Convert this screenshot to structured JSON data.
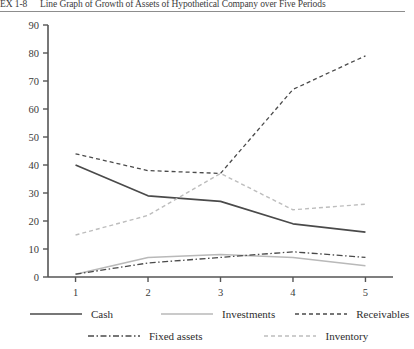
{
  "figure": {
    "tag": "EX 1-8",
    "title": "Line Graph of Growth of Assets of Hypothetical Company over Five Periods"
  },
  "legend": {
    "position": "below-plot",
    "items": [
      {
        "label": "Cash",
        "style": "solid",
        "color": "#4a4a4a",
        "width": 1.7
      },
      {
        "label": "Investments",
        "style": "solid",
        "color": "#b9b9b9",
        "width": 1.4
      },
      {
        "label": "Receivables",
        "style": "dashed",
        "color": "#4a4a4a",
        "width": 1.3
      },
      {
        "label": "Fixed assets",
        "style": "dash-dot",
        "color": "#4a4a4a",
        "width": 1.3
      },
      {
        "label": "Inventory",
        "style": "dashed",
        "color": "#bdbdbd",
        "width": 1.3
      }
    ]
  },
  "axes": {
    "y_ticks": [
      "0",
      "10",
      "20",
      "30",
      "40",
      "50",
      "60",
      "70",
      "80",
      "90"
    ],
    "x_ticks": [
      "1",
      "2",
      "3",
      "4",
      "5"
    ],
    "axis_color": "#555555"
  },
  "chart_data": {
    "type": "line",
    "title": "Line Graph of Growth of Assets of Hypothetical Company over Five Periods",
    "xlabel": "",
    "ylabel": "",
    "x": [
      1,
      2,
      3,
      4,
      5
    ],
    "categories": [
      "1",
      "2",
      "3",
      "4",
      "5"
    ],
    "xlim": [
      0.62,
      5.38
    ],
    "ylim": [
      0,
      90
    ],
    "yticks": [
      0,
      10,
      20,
      30,
      40,
      50,
      60,
      70,
      80,
      90
    ],
    "grid": false,
    "legend_position": "bottom",
    "series": [
      {
        "name": "Cash",
        "values": [
          40,
          29,
          27,
          19,
          16
        ],
        "style": "solid",
        "color": "#4a4a4a"
      },
      {
        "name": "Investments",
        "values": [
          1,
          7,
          8,
          7,
          4
        ],
        "style": "solid",
        "color": "#b9b9b9"
      },
      {
        "name": "Receivables",
        "values": [
          44,
          38,
          37,
          67,
          79
        ],
        "style": "dashed",
        "color": "#4a4a4a"
      },
      {
        "name": "Fixed assets",
        "values": [
          1,
          5,
          7,
          9,
          7
        ],
        "style": "dash-dot",
        "color": "#4a4a4a"
      },
      {
        "name": "Inventory",
        "values": [
          15,
          22,
          37,
          24,
          26
        ],
        "style": "dashed",
        "color": "#bdbdbd"
      }
    ]
  }
}
